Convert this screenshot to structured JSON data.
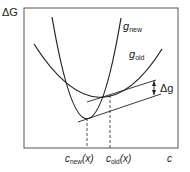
{
  "diagram": {
    "y_axis_label": "ΔG",
    "x_axis_label": "c",
    "curves": [
      {
        "name": "g",
        "subscript": "new"
      },
      {
        "name": "g",
        "subscript": "old"
      }
    ],
    "annotation": {
      "label": "Δg"
    },
    "x_markers": [
      {
        "name": "c",
        "subscript": "new",
        "suffix": "(x)"
      },
      {
        "name": "c",
        "subscript": "old",
        "suffix": "(x)"
      }
    ],
    "colors": {
      "line": "#222222",
      "frame": "#555555"
    }
  }
}
